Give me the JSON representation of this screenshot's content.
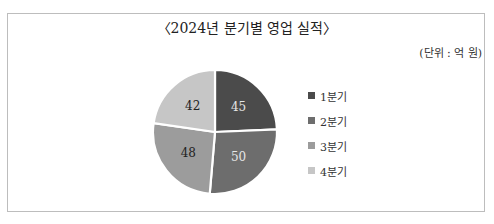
{
  "chart_data": {
    "type": "pie",
    "title": "〈2024년 분기별 영업 실적〉",
    "unit_label": "(단위 : 억 원)",
    "categories": [
      "1분기",
      "2분기",
      "3분기",
      "4분기"
    ],
    "values": [
      45,
      50,
      48,
      42
    ],
    "colors": [
      "#4b4b4b",
      "#6d6d6d",
      "#9c9c9c",
      "#c6c6c6"
    ],
    "label_colors": [
      "#e6e6e6",
      "#e6e6e6",
      "#222222",
      "#222222"
    ],
    "start_angle_deg": 0,
    "direction": "clockwise",
    "legend_position": "right",
    "data_labels": true
  }
}
